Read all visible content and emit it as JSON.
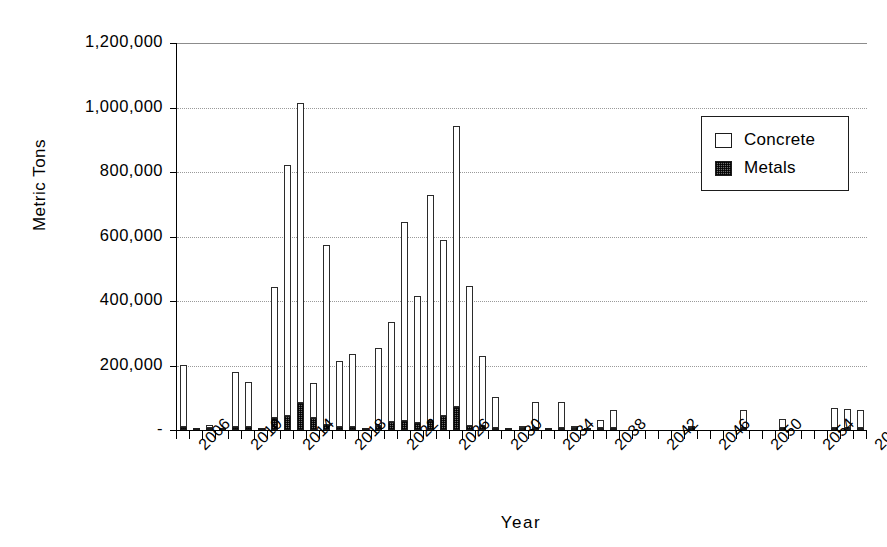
{
  "chart_data": {
    "type": "bar",
    "stacked": true,
    "title": "",
    "xlabel": "Year",
    "ylabel": "Metric Tons",
    "ylim": [
      0,
      1200000
    ],
    "ytick_values": [
      0,
      200000,
      400000,
      600000,
      800000,
      1000000,
      1200000
    ],
    "ytick_labels": [
      "-",
      "200,000",
      "400,000",
      "600,000",
      "800,000",
      "1,000,000",
      "1,200,000"
    ],
    "xtick_labels": [
      "2006",
      "2010",
      "2014",
      "2018",
      "2022",
      "2026",
      "2030",
      "2034",
      "2038",
      "2042",
      "2046",
      "2050",
      "2054",
      "2058"
    ],
    "grid": true,
    "legend_position": "upper-right",
    "series": [
      {
        "name": "Concrete",
        "color": "#ffffff",
        "edge_color": "#2b2b2b",
        "pattern": "solid-white"
      },
      {
        "name": "Metals",
        "color": "#6d6d6d",
        "edge_color": "#1d1d1d",
        "pattern": "dark-hatch"
      }
    ],
    "x": [
      2006,
      2007,
      2008,
      2009,
      2010,
      2011,
      2012,
      2013,
      2014,
      2015,
      2016,
      2017,
      2018,
      2019,
      2020,
      2021,
      2022,
      2023,
      2024,
      2025,
      2026,
      2027,
      2028,
      2029,
      2030,
      2031,
      2032,
      2033,
      2034,
      2035,
      2036,
      2037,
      2038,
      2039,
      2040,
      2041,
      2042,
      2043,
      2044,
      2045,
      2046,
      2047,
      2048,
      2049,
      2050,
      2051,
      2052,
      2053,
      2054,
      2055,
      2056,
      2057,
      2058
    ],
    "concrete": [
      192000,
      0,
      8000,
      0,
      172000,
      140000,
      0,
      405000,
      780000,
      930000,
      110000,
      560000,
      205000,
      228000,
      0,
      240000,
      310000,
      618000,
      395000,
      700000,
      545000,
      870000,
      435000,
      215000,
      95000,
      0,
      4000,
      80000,
      0,
      78000,
      3000,
      0,
      22000,
      55000,
      0,
      0,
      0,
      0,
      0,
      2000,
      0,
      0,
      0,
      54000,
      0,
      0,
      25000,
      0,
      0,
      0,
      60000,
      58000,
      55000
    ],
    "metals": [
      9000,
      2000,
      4000,
      1000,
      8000,
      8000,
      1000,
      38000,
      42000,
      85000,
      36000,
      15000,
      10000,
      9000,
      1000,
      14000,
      24000,
      28000,
      22000,
      28000,
      45000,
      72000,
      12000,
      14000,
      5000,
      1000,
      2000,
      5000,
      1000,
      4000,
      1000,
      1000,
      2000,
      4000,
      0,
      0,
      0,
      0,
      0,
      2000,
      0,
      0,
      0,
      4000,
      0,
      0,
      2000,
      0,
      0,
      0,
      6000,
      5000,
      5000
    ],
    "total": [
      201000,
      2000,
      12000,
      1000,
      180000,
      148000,
      1000,
      443000,
      822000,
      1015000,
      146000,
      575000,
      215000,
      237000,
      1000,
      254000,
      334000,
      646000,
      417000,
      728000,
      590000,
      942000,
      447000,
      229000,
      100000,
      1000,
      6000,
      85000,
      1000,
      82000,
      4000,
      1000,
      24000,
      59000,
      0,
      0,
      0,
      0,
      0,
      4000,
      0,
      0,
      0,
      58000,
      0,
      0,
      27000,
      0,
      0,
      0,
      66000,
      63000,
      60000
    ]
  },
  "legend": {
    "items": [
      {
        "label": "Concrete",
        "swatch": "concrete"
      },
      {
        "label": "Metals",
        "swatch": "metals"
      }
    ]
  }
}
